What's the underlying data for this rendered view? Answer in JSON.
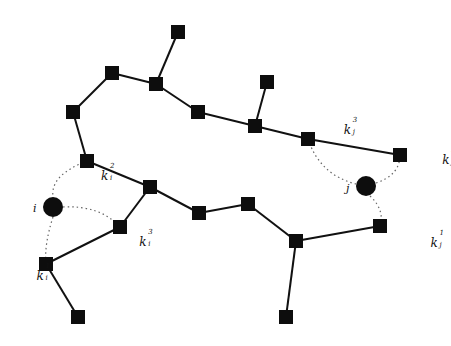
{
  "diagram": {
    "colors": {
      "node": "#0d0d0d",
      "edge": "#111111",
      "dotted": "#666666",
      "background": "#ffffff"
    },
    "square_size": 14,
    "nodes": [
      {
        "id": "n1",
        "x": 178,
        "y": 32
      },
      {
        "id": "n2",
        "x": 112,
        "y": 73
      },
      {
        "id": "n3",
        "x": 156,
        "y": 84
      },
      {
        "id": "n4",
        "x": 73,
        "y": 112
      },
      {
        "id": "n5",
        "x": 198,
        "y": 112
      },
      {
        "id": "n6",
        "x": 267,
        "y": 82
      },
      {
        "id": "n7",
        "x": 255,
        "y": 126
      },
      {
        "id": "n8",
        "x": 308,
        "y": 139
      },
      {
        "id": "n9",
        "x": 400,
        "y": 155
      },
      {
        "id": "n10",
        "x": 87,
        "y": 161
      },
      {
        "id": "n11",
        "x": 150,
        "y": 187
      },
      {
        "id": "n12",
        "x": 199,
        "y": 213
      },
      {
        "id": "n13",
        "x": 248,
        "y": 204
      },
      {
        "id": "n14",
        "x": 120,
        "y": 227
      },
      {
        "id": "n15",
        "x": 296,
        "y": 241
      },
      {
        "id": "n16",
        "x": 380,
        "y": 226
      },
      {
        "id": "n17",
        "x": 46,
        "y": 264
      },
      {
        "id": "n18",
        "x": 78,
        "y": 317
      },
      {
        "id": "n19",
        "x": 286,
        "y": 317
      }
    ],
    "circles": [
      {
        "id": "i",
        "label": "i",
        "x": 53,
        "y": 207,
        "r": 10,
        "label_x": 33,
        "label_y": 203
      },
      {
        "id": "j",
        "label": "j",
        "x": 366,
        "y": 186,
        "r": 10,
        "label_x": 346,
        "label_y": 183
      }
    ],
    "edges": [
      [
        "n1",
        "n3"
      ],
      [
        "n2",
        "n3"
      ],
      [
        "n2",
        "n4"
      ],
      [
        "n4",
        "n10"
      ],
      [
        "n3",
        "n5"
      ],
      [
        "n5",
        "n7"
      ],
      [
        "n6",
        "n7"
      ],
      [
        "n7",
        "n8"
      ],
      [
        "n8",
        "n9"
      ],
      [
        "n10",
        "n11"
      ],
      [
        "n11",
        "n14"
      ],
      [
        "n11",
        "n12"
      ],
      [
        "n12",
        "n13"
      ],
      [
        "n13",
        "n15"
      ],
      [
        "n15",
        "n16"
      ],
      [
        "n15",
        "n19"
      ],
      [
        "n14",
        "n17"
      ],
      [
        "n17",
        "n18"
      ]
    ],
    "dotted_links": [
      {
        "path": "M 87 161 Q 50 175 53 197"
      },
      {
        "path": "M 63 207 Q 100 205 120 227"
      },
      {
        "path": "M 53 217 Q 44 245 46 264"
      },
      {
        "path": "M 308 139 Q 320 175 356 184"
      },
      {
        "path": "M 376 183 Q 400 175 400 155"
      },
      {
        "path": "M 370 196 Q 385 210 380 226"
      }
    ],
    "labels": [
      {
        "id": "k_i_2",
        "base": "k",
        "sup": "2",
        "sub": "i",
        "x": 101,
        "y": 166
      },
      {
        "id": "k_i_3",
        "base": "k",
        "sup": "3",
        "sub": "i",
        "x": 132,
        "y": 232
      },
      {
        "id": "k_i_1",
        "base": "k",
        "sup": "1",
        "sub": "i",
        "x": 22,
        "y": 266
      },
      {
        "id": "k_j_3",
        "base": "k",
        "sup": "3",
        "sub": "j",
        "x": 322,
        "y": 120
      },
      {
        "id": "k_j_2",
        "base": "k",
        "sup": "2",
        "sub": "j",
        "x": 413,
        "y": 150
      },
      {
        "id": "k_j_1",
        "base": "k",
        "sup": "1",
        "sub": "j",
        "x": 394,
        "y": 233
      }
    ]
  }
}
